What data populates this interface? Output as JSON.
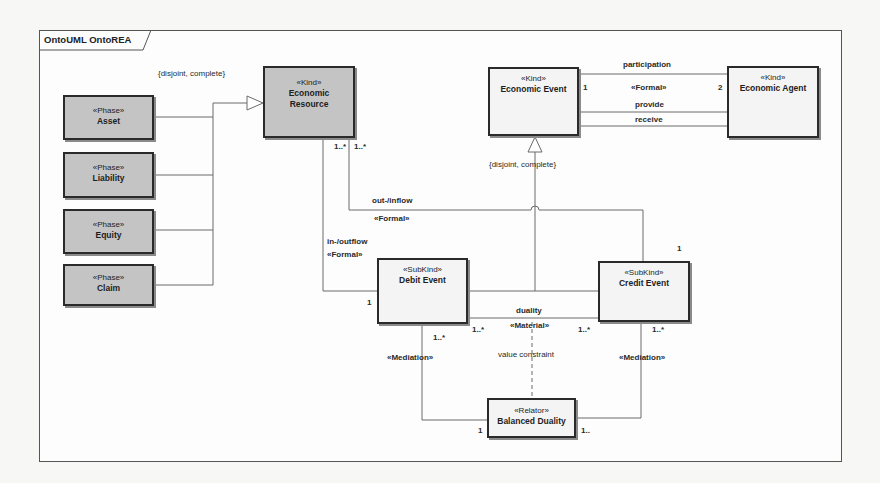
{
  "frame": {
    "title": "OntoUML OntoREA"
  },
  "classes": {
    "asset": {
      "stereotype": "«Phase»",
      "name": "Asset"
    },
    "liability": {
      "stereotype": "«Phase»",
      "name": "Liability"
    },
    "equity": {
      "stereotype": "«Phase»",
      "name": "Equity"
    },
    "claim": {
      "stereotype": "«Phase»",
      "name": "Claim"
    },
    "economic_resource": {
      "stereotype": "«Kind»",
      "name": "Economic Resource"
    },
    "economic_event": {
      "stereotype": "«Kind»",
      "name": "Economic Event"
    },
    "economic_agent": {
      "stereotype": "«Kind»",
      "name": "Economic Agent"
    },
    "debit_event": {
      "stereotype": "«SubKind»",
      "name": "Debit Event"
    },
    "credit_event": {
      "stereotype": "«SubKind»",
      "name": "Credit Event"
    },
    "balanced_duality": {
      "stereotype": "«Relator»",
      "name": "Balanced Duality"
    }
  },
  "generalization_sets": {
    "resource_phases": "{disjoint, complete}",
    "event_subkinds": "{disjoint, complete}"
  },
  "associations": {
    "participation": {
      "name": "participation",
      "stereotype": "«Formal»",
      "mult_event": "1",
      "mult_agent": "2"
    },
    "provide": {
      "name": "provide"
    },
    "receive": {
      "name": "receive"
    },
    "out_inflow": {
      "name": "out-/inflow",
      "stereotype": "«Formal»",
      "mult_resource": "1..*",
      "mult_credit": "1"
    },
    "in_outflow": {
      "name": "in-/outflow",
      "stereotype": "«Formal»",
      "mult_resource": "1..*",
      "mult_debit": "1"
    },
    "duality": {
      "name": "duality",
      "stereotype": "«Material»",
      "mult_debit": "1..*",
      "mult_credit": "1..*"
    },
    "value_constraint": {
      "name": "value constraint"
    },
    "mediation_debit": {
      "stereotype": "«Mediation»",
      "mult_debit": "1..*",
      "mult_relator": "1"
    },
    "mediation_credit": {
      "stereotype": "«Mediation»",
      "mult_credit": "1..*",
      "mult_relator": "1.."
    }
  }
}
